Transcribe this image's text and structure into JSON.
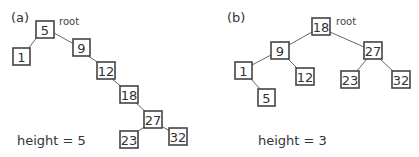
{
  "panels": [
    {
      "label": "(a)",
      "root_label": "root",
      "caption": "height = 5",
      "nodes": [
        {
          "id": "5",
          "text": "5"
        },
        {
          "id": "1",
          "text": "1"
        },
        {
          "id": "9",
          "text": "9"
        },
        {
          "id": "12",
          "text": "12"
        },
        {
          "id": "18",
          "text": "18"
        },
        {
          "id": "27",
          "text": "27"
        },
        {
          "id": "23",
          "text": "23"
        },
        {
          "id": "32",
          "text": "32"
        }
      ],
      "edges": [
        [
          "5",
          "1"
        ],
        [
          "5",
          "9"
        ],
        [
          "9",
          "12"
        ],
        [
          "12",
          "18"
        ],
        [
          "18",
          "27"
        ],
        [
          "27",
          "23"
        ],
        [
          "27",
          "32"
        ]
      ]
    },
    {
      "label": "(b)",
      "root_label": "root",
      "caption": "height = 3",
      "nodes": [
        {
          "id": "18",
          "text": "18"
        },
        {
          "id": "9",
          "text": "9"
        },
        {
          "id": "1",
          "text": "1"
        },
        {
          "id": "5",
          "text": "5"
        },
        {
          "id": "12",
          "text": "12"
        },
        {
          "id": "27",
          "text": "27"
        },
        {
          "id": "23",
          "text": "23"
        },
        {
          "id": "32",
          "text": "32"
        }
      ],
      "edges": [
        [
          "18",
          "9"
        ],
        [
          "18",
          "27"
        ],
        [
          "9",
          "1"
        ],
        [
          "9",
          "12"
        ],
        [
          "1",
          "5"
        ],
        [
          "27",
          "23"
        ],
        [
          "27",
          "32"
        ]
      ]
    }
  ]
}
